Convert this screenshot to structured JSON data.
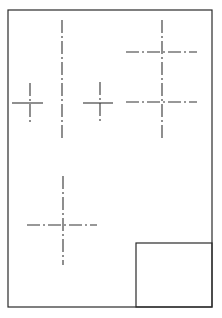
{
  "drawing": {
    "type": "technical-drawing-sheet",
    "colors": {
      "line": "#333333",
      "background": "#ffffff"
    },
    "sheet_border": {
      "x": 8,
      "y": 10,
      "width": 204,
      "height": 297
    },
    "title_block": {
      "x": 136,
      "y": 243,
      "width": 76,
      "height": 64
    },
    "center_marks": [
      {
        "name": "left-small-cross",
        "cx": 30,
        "cy": 103,
        "h": [
          12,
          44
        ],
        "v": [
          83,
          122
        ]
      },
      {
        "name": "tall-vertical-centerline",
        "cx": 62,
        "v": [
          20,
          141
        ]
      },
      {
        "name": "middle-small-cross",
        "cx": 100,
        "cy": 103,
        "h": [
          83,
          114
        ],
        "v": [
          82,
          122
        ]
      },
      {
        "name": "right-vertical-centerline",
        "cx": 162,
        "v": [
          20,
          140
        ]
      },
      {
        "name": "right-upper-horizontal",
        "cy": 52,
        "h": [
          126,
          197
        ]
      },
      {
        "name": "right-lower-horizontal",
        "cy": 102,
        "h": [
          126,
          197
        ]
      },
      {
        "name": "bottom-cross",
        "cx": 63,
        "cy": 225,
        "h": [
          27,
          97
        ],
        "v": [
          176,
          265
        ]
      }
    ]
  }
}
